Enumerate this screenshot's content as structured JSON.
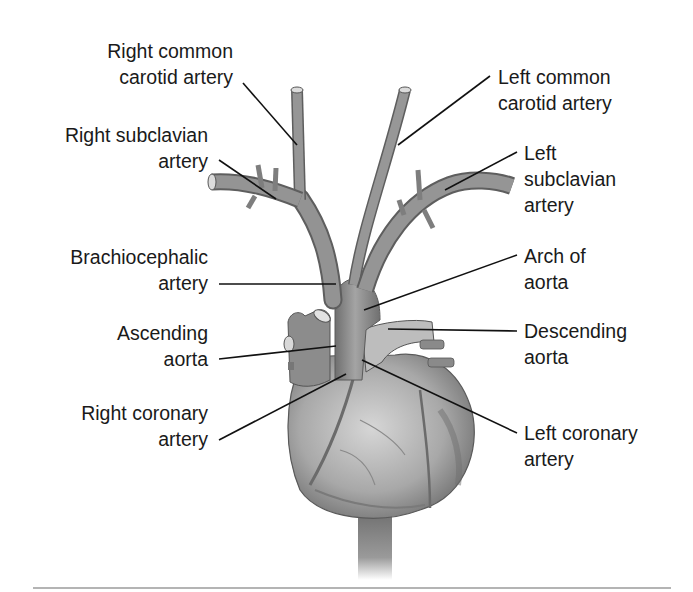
{
  "figure": {
    "labels": [
      {
        "id": "right-common-carotid",
        "lines": [
          "Right common",
          "carotid artery"
        ],
        "side": "left",
        "x": 230,
        "y": 38,
        "anchor": [
          243,
          83
        ],
        "target": [
          297,
          145
        ]
      },
      {
        "id": "right-subclavian",
        "lines": [
          "Right subclavian",
          "artery"
        ],
        "side": "left",
        "x": 208,
        "y": 147,
        "anchor": [
          219,
          160
        ],
        "target": [
          276,
          199
        ]
      },
      {
        "id": "brachiocephalic",
        "lines": [
          "Brachiocephalic",
          "artery"
        ],
        "side": "left",
        "x": 208,
        "y": 244,
        "anchor": [
          219,
          284
        ],
        "target": [
          336,
          284
        ]
      },
      {
        "id": "ascending-aorta",
        "lines": [
          "Ascending",
          "aorta"
        ],
        "side": "left",
        "x": 208,
        "y": 322,
        "anchor": [
          219,
          359
        ],
        "target": [
          336,
          346
        ]
      },
      {
        "id": "right-coronary",
        "lines": [
          "Right coronary",
          "artery"
        ],
        "side": "left",
        "x": 208,
        "y": 400,
        "anchor": [
          219,
          440
        ],
        "target": [
          346,
          374
        ]
      },
      {
        "id": "left-common-carotid",
        "lines": [
          "Left common",
          "carotid artery"
        ],
        "side": "right",
        "x": 498,
        "y": 64,
        "anchor": [
          490,
          76
        ],
        "target": [
          398,
          145
        ]
      },
      {
        "id": "left-subclavian",
        "lines": [
          "Left",
          "subclavian",
          "artery"
        ],
        "side": "right",
        "x": 524,
        "y": 140,
        "anchor": [
          517,
          152
        ],
        "target": [
          445,
          190
        ]
      },
      {
        "id": "arch-of-aorta",
        "lines": [
          "Arch of",
          "aorta"
        ],
        "side": "right",
        "x": 524,
        "y": 243,
        "anchor": [
          517,
          255
        ],
        "target": [
          364,
          310
        ]
      },
      {
        "id": "descending-aorta",
        "lines": [
          "Descending",
          "aorta"
        ],
        "side": "right",
        "x": 524,
        "y": 320,
        "anchor": [
          517,
          331
        ],
        "target": [
          388,
          329
        ]
      },
      {
        "id": "left-coronary",
        "lines": [
          "Left coronary",
          "artery"
        ],
        "side": "right",
        "x": 524,
        "y": 423,
        "anchor": [
          517,
          433
        ],
        "target": [
          362,
          360
        ]
      }
    ]
  },
  "colors": {
    "text": "#1a1a1a",
    "leader": "#111111",
    "vessel": "#8a8a8a",
    "vessel_dark": "#5e5e5e",
    "heart": "#a9a9a9",
    "rule": "#b4b4b4"
  }
}
